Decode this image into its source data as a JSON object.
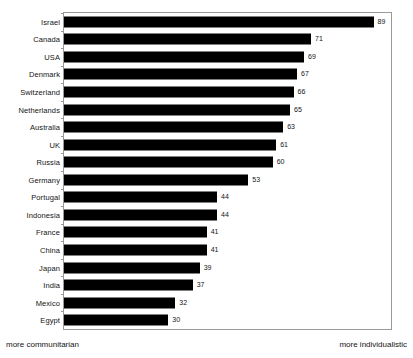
{
  "chart_data": {
    "type": "bar",
    "orientation": "horizontal",
    "title": "",
    "subtitle": "",
    "xlabel": "",
    "ylabel": "",
    "xlim": [
      0,
      94
    ],
    "grid": false,
    "legend": null,
    "bar_color": "#000000",
    "frame_color": "#9a9a9a",
    "background": "#ffffff",
    "categories": [
      "Israel",
      "Canada",
      "USA",
      "Denmark",
      "Switzerland",
      "Netherlands",
      "Australia",
      "UK",
      "Russia",
      "Germany",
      "Portugal",
      "Indonesia",
      "France",
      "China",
      "Japan",
      "India",
      "Mexico",
      "Egypt"
    ],
    "values": [
      89,
      71,
      69,
      67,
      66,
      65,
      63,
      61,
      60,
      53,
      44,
      44,
      41,
      41,
      39,
      37,
      32,
      30
    ],
    "data_labels": [
      "89",
      "71",
      "69",
      "67",
      "66",
      "65",
      "63",
      "61",
      "60",
      "53",
      "44",
      "44",
      "41",
      "41",
      "39",
      "37",
      "32",
      "30"
    ],
    "annotations": {
      "left_axis_note": "more communitarian",
      "right_axis_note": "more individualistic"
    }
  }
}
